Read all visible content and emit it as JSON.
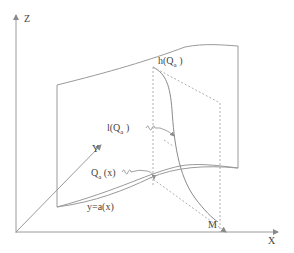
{
  "diagram": {
    "type": "3d-coordinate-sketch",
    "axes": {
      "x_label": "X",
      "y_label": "Y",
      "z_label": "Z"
    },
    "labels": {
      "h": {
        "main": "h(Q",
        "sub": "a",
        "close": " )"
      },
      "l": {
        "main": "l(Q",
        "sub": "a",
        "close": " )"
      },
      "q": {
        "main": "Q",
        "sub": "a",
        "close": " (x)"
      },
      "curve": "y=a(x)",
      "point": "M"
    },
    "colors": {
      "line": "#9a9a9a",
      "dashed": "#b0b0b0",
      "text": "#444444",
      "background": "#ffffff"
    }
  }
}
